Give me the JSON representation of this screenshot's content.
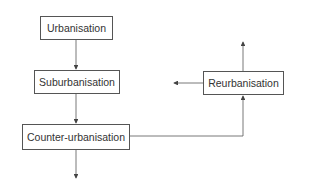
{
  "diagram": {
    "nodes": [
      {
        "id": "urbanisation",
        "label": "Urbanisation"
      },
      {
        "id": "suburbanisation",
        "label": "Suburbanisation"
      },
      {
        "id": "counter_urbanisation",
        "label": "Counter-urbanisation"
      },
      {
        "id": "reurbanisation",
        "label": "Reurbanisation"
      }
    ],
    "edges": [
      {
        "from": "urbanisation",
        "to": "suburbanisation"
      },
      {
        "from": "suburbanisation",
        "to": "counter_urbanisation"
      },
      {
        "from": "counter_urbanisation",
        "to": "reurbanisation"
      },
      {
        "from": "counter_urbanisation",
        "to": "(down, open-ended)"
      },
      {
        "from": "reurbanisation",
        "to": "(up, open-ended)"
      },
      {
        "from": "reurbanisation",
        "to": "(left, open-ended)"
      }
    ],
    "colors": {
      "line": "#555555",
      "text": "#333333",
      "background": "#ffffff"
    }
  }
}
